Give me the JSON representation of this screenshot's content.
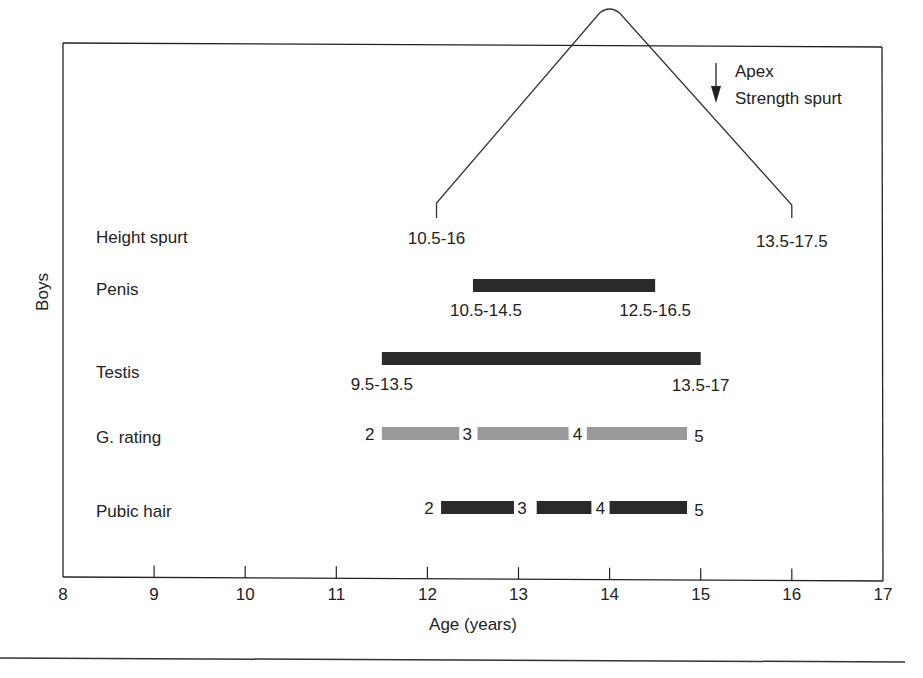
{
  "chart_data": {
    "type": "bar",
    "subtype": "range-timeline",
    "title": "",
    "xlabel": "Age (years)",
    "ylabel": "Boys",
    "xlim": [
      8,
      17
    ],
    "x_ticks": [
      "8",
      "9",
      "10",
      "11",
      "12",
      "13",
      "14",
      "15",
      "16",
      "17"
    ],
    "grid": false,
    "legend": null,
    "annotation": {
      "arrow_label_line1": "Apex",
      "arrow_label_line2": "Strength spurt"
    },
    "rows": [
      {
        "name": "Height spurt",
        "shape": "peak",
        "start": 12.1,
        "apex": 14.0,
        "end": 16.0,
        "start_label": "10.5-16",
        "end_label": "13.5-17.5"
      },
      {
        "name": "Penis",
        "shape": "bar",
        "start": 12.5,
        "end": 14.5,
        "color": "#2a2a2a",
        "start_label": "10.5-14.5",
        "end_label": "12.5-16.5"
      },
      {
        "name": "Testis",
        "shape": "bar",
        "start": 11.5,
        "end": 15.0,
        "color": "#2a2a2a",
        "start_label": "9.5-13.5",
        "end_label": "13.5-17"
      },
      {
        "name": "G. rating",
        "shape": "stages",
        "color": "#9a9a9a",
        "segments": [
          {
            "start": 11.5,
            "end": 12.35
          },
          {
            "start": 12.55,
            "end": 13.55
          },
          {
            "start": 13.75,
            "end": 14.85
          }
        ],
        "stage_labels": [
          "2",
          "3",
          "4",
          "5"
        ]
      },
      {
        "name": "Pubic hair",
        "shape": "stages",
        "color": "#2a2a2a",
        "segments": [
          {
            "start": 12.15,
            "end": 12.95
          },
          {
            "start": 13.2,
            "end": 13.8
          },
          {
            "start": 14.0,
            "end": 14.85
          }
        ],
        "stage_labels": [
          "2",
          "3",
          "4",
          "5"
        ]
      }
    ]
  }
}
